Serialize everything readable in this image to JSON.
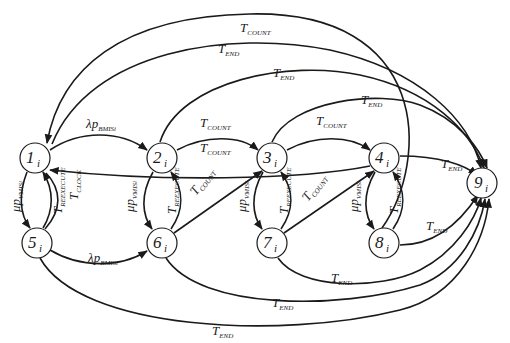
{
  "diagram": {
    "type": "state-transition",
    "colors": {
      "stroke": "#1a1a1a",
      "background": "#ffffff"
    },
    "nodes": [
      {
        "id": "1",
        "label": "1",
        "sub": "i"
      },
      {
        "id": "2",
        "label": "2",
        "sub": "i"
      },
      {
        "id": "3",
        "label": "3",
        "sub": "i"
      },
      {
        "id": "4",
        "label": "4",
        "sub": "i"
      },
      {
        "id": "5",
        "label": "5",
        "sub": "i"
      },
      {
        "id": "6",
        "label": "6",
        "sub": "i"
      },
      {
        "id": "7",
        "label": "7",
        "sub": "i"
      },
      {
        "id": "8",
        "label": "8",
        "sub": "i"
      },
      {
        "id": "9",
        "label": "9",
        "sub": "i"
      }
    ],
    "edges": [
      {
        "from": "1",
        "to": "2",
        "main": "λp",
        "sub": "BMISi"
      },
      {
        "from": "5",
        "to": "6",
        "main": "λp",
        "sub": "BMISi"
      },
      {
        "from": "1",
        "to": "5",
        "main": "μp",
        "sub": "VMISi"
      },
      {
        "from": "5",
        "to": "1",
        "main": "T",
        "sub": "REEXECUTE"
      },
      {
        "from": "5",
        "to": "1",
        "main": "T",
        "sub": "CLOCK"
      },
      {
        "from": "2",
        "to": "6",
        "main": "μp",
        "sub": "VMISi"
      },
      {
        "from": "6",
        "to": "2",
        "main": "T",
        "sub": "REEXECUTE"
      },
      {
        "from": "6",
        "to": "3",
        "main": "T",
        "sub": "COUNT"
      },
      {
        "from": "2",
        "to": "3",
        "main": "T",
        "sub": "COUNT"
      },
      {
        "from": "3",
        "to": "1",
        "main": "T",
        "sub": "COUNT"
      },
      {
        "from": "3",
        "to": "7",
        "main": "μp",
        "sub": "VMISi"
      },
      {
        "from": "7",
        "to": "3",
        "main": "T",
        "sub": "REEXECUTE"
      },
      {
        "from": "7",
        "to": "4",
        "main": "T",
        "sub": "COUNT"
      },
      {
        "from": "3",
        "to": "4",
        "main": "T",
        "sub": "COUNT"
      },
      {
        "from": "4",
        "to": "8",
        "main": "μp",
        "sub": "VMISi"
      },
      {
        "from": "8",
        "to": "4",
        "main": "T",
        "sub": "REEXECUTE"
      },
      {
        "from": "4",
        "to": "9",
        "main": "T",
        "sub": "END"
      },
      {
        "from": "8",
        "to": "9",
        "main": "T",
        "sub": "END"
      },
      {
        "from": "7",
        "to": "9",
        "main": "T",
        "sub": "END"
      },
      {
        "from": "6",
        "to": "9",
        "main": "T",
        "sub": "END"
      },
      {
        "from": "5",
        "to": "9",
        "main": "T",
        "sub": "END"
      },
      {
        "from": "3",
        "to": "9",
        "main": "T",
        "sub": "END"
      },
      {
        "from": "2",
        "to": "9",
        "main": "T",
        "sub": "END"
      },
      {
        "from": "1",
        "to": "9",
        "main": "T",
        "sub": "END"
      },
      {
        "from": "8",
        "to": "1",
        "main": "T",
        "sub": "COUNT"
      }
    ]
  }
}
